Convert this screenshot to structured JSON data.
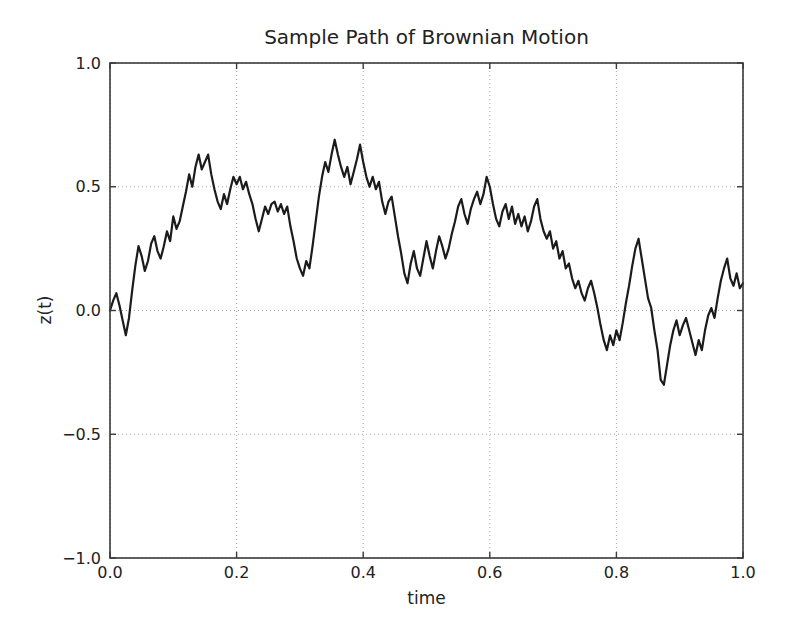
{
  "figure": {
    "background": "#ffffff"
  },
  "chart_data": {
    "type": "line",
    "title": "Sample Path of Brownian Motion",
    "xlabel": "time",
    "ylabel": "z(t)",
    "xlim": [
      0.0,
      1.0
    ],
    "ylim": [
      -1.0,
      1.0
    ],
    "xticks": [
      0.0,
      0.2,
      0.4,
      0.6,
      0.8,
      1.0
    ],
    "xtick_labels": [
      "0.0",
      "0.2",
      "0.4",
      "0.6",
      "0.8",
      "1.0"
    ],
    "yticks": [
      -1.0,
      -0.5,
      0.0,
      0.5,
      1.0
    ],
    "ytick_labels": [
      "−1.0",
      "−0.5",
      "0.0",
      "0.5",
      "1.0"
    ],
    "grid": true,
    "grid_style": "dotted",
    "legend": "none",
    "colors": {
      "line": "#1b1b1b",
      "grid": "#a8a8a8",
      "spine": "#3a3a3a",
      "text": "#222222",
      "background": "#ffffff"
    },
    "series": [
      {
        "name": "brownian-path",
        "x_start": 0.0,
        "x_step": 0.005,
        "values": [
          0.0,
          0.04,
          0.07,
          0.02,
          -0.04,
          -0.1,
          -0.03,
          0.08,
          0.18,
          0.26,
          0.22,
          0.16,
          0.2,
          0.27,
          0.3,
          0.24,
          0.21,
          0.26,
          0.32,
          0.28,
          0.38,
          0.33,
          0.36,
          0.42,
          0.48,
          0.55,
          0.5,
          0.58,
          0.63,
          0.57,
          0.6,
          0.63,
          0.55,
          0.49,
          0.44,
          0.41,
          0.47,
          0.43,
          0.49,
          0.54,
          0.51,
          0.54,
          0.49,
          0.52,
          0.47,
          0.43,
          0.37,
          0.32,
          0.37,
          0.42,
          0.39,
          0.43,
          0.44,
          0.4,
          0.43,
          0.39,
          0.42,
          0.34,
          0.28,
          0.21,
          0.17,
          0.14,
          0.2,
          0.17,
          0.26,
          0.36,
          0.46,
          0.54,
          0.6,
          0.56,
          0.63,
          0.69,
          0.63,
          0.58,
          0.54,
          0.58,
          0.51,
          0.56,
          0.61,
          0.67,
          0.6,
          0.54,
          0.5,
          0.54,
          0.49,
          0.52,
          0.44,
          0.39,
          0.44,
          0.46,
          0.38,
          0.3,
          0.23,
          0.15,
          0.11,
          0.19,
          0.24,
          0.17,
          0.14,
          0.21,
          0.28,
          0.22,
          0.17,
          0.24,
          0.3,
          0.26,
          0.21,
          0.25,
          0.31,
          0.36,
          0.42,
          0.45,
          0.39,
          0.35,
          0.41,
          0.45,
          0.48,
          0.43,
          0.47,
          0.54,
          0.5,
          0.43,
          0.37,
          0.34,
          0.4,
          0.43,
          0.37,
          0.42,
          0.35,
          0.39,
          0.34,
          0.38,
          0.32,
          0.36,
          0.42,
          0.45,
          0.37,
          0.32,
          0.29,
          0.32,
          0.25,
          0.28,
          0.21,
          0.24,
          0.17,
          0.19,
          0.13,
          0.09,
          0.12,
          0.07,
          0.04,
          0.09,
          0.12,
          0.07,
          0.01,
          -0.06,
          -0.12,
          -0.16,
          -0.1,
          -0.14,
          -0.08,
          -0.12,
          -0.05,
          0.03,
          0.1,
          0.18,
          0.25,
          0.29,
          0.21,
          0.13,
          0.05,
          0.01,
          -0.08,
          -0.16,
          -0.28,
          -0.3,
          -0.22,
          -0.14,
          -0.08,
          -0.04,
          -0.1,
          -0.06,
          -0.03,
          -0.08,
          -0.13,
          -0.18,
          -0.12,
          -0.16,
          -0.08,
          -0.02,
          0.01,
          -0.03,
          0.05,
          0.12,
          0.17,
          0.21,
          0.13,
          0.1,
          0.15,
          0.09,
          0.11
        ]
      }
    ]
  }
}
